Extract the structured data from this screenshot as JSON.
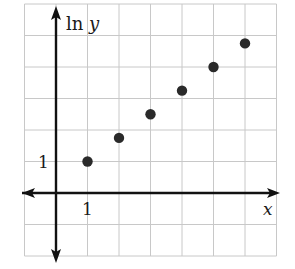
{
  "chart_data": {
    "type": "scatter",
    "title": "",
    "xlabel": "x",
    "ylabel": "ln y",
    "x_tick_labels": [
      "1"
    ],
    "y_tick_labels": [
      "1"
    ],
    "x": [
      1,
      2,
      3,
      4,
      5,
      6
    ],
    "series": [
      {
        "name": "ln y",
        "values": [
          1,
          1.75,
          2.5,
          3.25,
          4,
          4.75
        ]
      }
    ],
    "xlim": [
      -1,
      7
    ],
    "ylim": [
      -2,
      6
    ],
    "grid": true,
    "legend": null,
    "colors": {
      "grid": "#c8c8c8",
      "axis": "#111111",
      "point": "#2a2a2a"
    }
  },
  "labels": {
    "y_axis": "ln y",
    "x_axis": "x",
    "x_tick": "1",
    "y_tick": "1"
  }
}
